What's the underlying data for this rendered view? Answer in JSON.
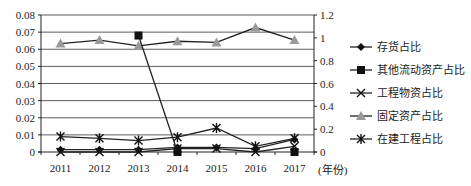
{
  "chart_data": {
    "type": "line",
    "title": "",
    "xlabel": "(年份)",
    "ylabel_left": "",
    "ylabel_right": "",
    "categories": [
      "2011",
      "2012",
      "2013",
      "2014",
      "2015",
      "2016",
      "2017"
    ],
    "left_axis": {
      "ylim": [
        0,
        0.08
      ],
      "ticks": [
        "0",
        "0.01",
        "0.02",
        "0.03",
        "0.04",
        "0.05",
        "0.06",
        "0.07",
        "0.08"
      ]
    },
    "right_axis": {
      "ylim": [
        0,
        1.2
      ],
      "ticks": [
        "0",
        "0.2",
        "0.4",
        "0.6",
        "0.8",
        "1",
        "1.2"
      ]
    },
    "grid": true,
    "legend_position": "right",
    "series": [
      {
        "name": "存货占比",
        "axis": "right",
        "marker": "diamond",
        "color": "#111111",
        "values": [
          0.02,
          0.02,
          0.02,
          0.04,
          0.04,
          0.03,
          0.11
        ]
      },
      {
        "name": "其他流动资产占比",
        "axis": "left",
        "marker": "square",
        "color": "#111111",
        "values": [
          null,
          null,
          0.068,
          0.0,
          null,
          null,
          0.0
        ]
      },
      {
        "name": "工程物资占比",
        "axis": "right",
        "marker": "x",
        "color": "#111111",
        "values": [
          0.0,
          0.0,
          0.0,
          0.03,
          0.03,
          0.0,
          0.05
        ]
      },
      {
        "name": "固定资产占比",
        "axis": "right",
        "marker": "triangle",
        "color": "#999999",
        "values": [
          0.95,
          0.98,
          0.93,
          0.97,
          0.96,
          1.09,
          0.98
        ]
      },
      {
        "name": "在建工程占比",
        "axis": "right",
        "marker": "asterisk",
        "color": "#111111",
        "values": [
          0.135,
          0.12,
          0.1,
          0.13,
          0.21,
          0.05,
          0.12
        ]
      }
    ]
  },
  "legend": {
    "items": [
      "存货占比",
      "其他流动资产占比",
      "工程物资占比",
      "固定资产占比",
      "在建工程占比"
    ]
  }
}
